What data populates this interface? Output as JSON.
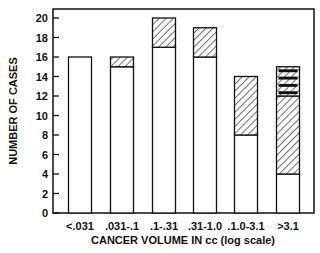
{
  "chart_data": {
    "type": "bar",
    "stacked": true,
    "title": "",
    "xlabel": "CANCER VOLUME IN cc (log scale)",
    "ylabel": "NUMBER OF CASES",
    "ylim": [
      0,
      20
    ],
    "yticks": [
      0,
      2,
      4,
      6,
      8,
      10,
      12,
      14,
      16,
      18,
      20
    ],
    "grid": false,
    "legend": null,
    "categories": [
      "<.031",
      ".031-.1",
      ".1-.31",
      ".31-1.0",
      ".1.0-3.1",
      ">3.1"
    ],
    "series": [
      {
        "name": "open (white)",
        "pattern": "none",
        "values": [
          16,
          15,
          17,
          16,
          8,
          4
        ]
      },
      {
        "name": "hatched",
        "pattern": "diagonal-hatch",
        "values": [
          0,
          1,
          3,
          3,
          6,
          8
        ]
      },
      {
        "name": "hatched with black bars",
        "pattern": "hatch-black-stripes",
        "values": [
          0,
          0,
          0,
          0,
          0,
          3
        ]
      }
    ],
    "totals": [
      16,
      16,
      20,
      19,
      14,
      15
    ]
  },
  "colors": {
    "ink": "#111111",
    "background": "#ffffff"
  }
}
